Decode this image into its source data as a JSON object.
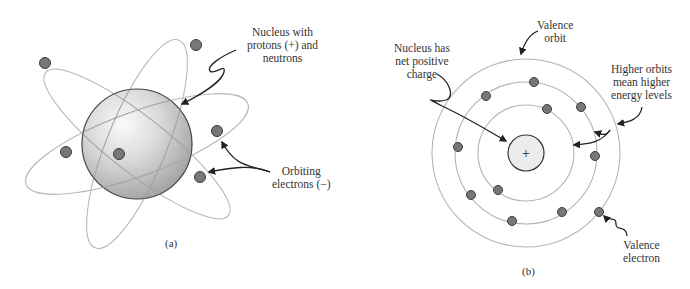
{
  "panel_a": {
    "caption": "(a)",
    "nucleus_label": [
      "Nucleus with",
      "protons (+) and",
      "neutrons"
    ],
    "electrons_label": [
      "Orbiting",
      "electrons (−)"
    ],
    "colors": {
      "orbit": "#b5b5b5",
      "electron": "#7a7a7a",
      "electron_stroke": "#3a3a3a",
      "nucleus_light": "#f4f4f4",
      "nucleus_dark": "#a8a8a8"
    }
  },
  "panel_b": {
    "caption": "(b)",
    "nucleus_symbol": "+",
    "nucleus_label": [
      "Nucleus has",
      "net positive",
      "charge"
    ],
    "valence_orbit_label": [
      "Valence",
      "orbit"
    ],
    "higher_orbits_label": [
      "Higher orbits",
      "mean higher",
      "energy levels"
    ],
    "valence_electron_label": [
      "Valence",
      "electron"
    ],
    "colors": {
      "orbit": "#b0b0b0",
      "electron": "#7a7a7a",
      "nucleus_fill": "#ececec"
    }
  }
}
